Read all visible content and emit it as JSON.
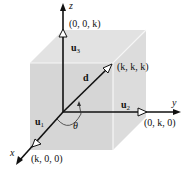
{
  "diagram": {
    "type": "3d-coordinate-cube",
    "colors": {
      "cube_fill": "#d9d9d9",
      "cube_top": "#e3e3e3",
      "cube_edge": "#f4f4f4",
      "axis": "#111111",
      "background": "#ffffff"
    },
    "axes": {
      "x": {
        "label": "x"
      },
      "y": {
        "label": "y"
      },
      "z": {
        "label": "z"
      }
    },
    "points": {
      "x_point": "(k, 0, 0)",
      "y_point": "(0, k, 0)",
      "z_point": "(0, 0, k)",
      "diag_point": "(k, k, k)"
    },
    "vectors": {
      "u1": {
        "symbol": "u",
        "sub": "1"
      },
      "u2": {
        "symbol": "u",
        "sub": "2"
      },
      "u3": {
        "symbol": "u",
        "sub": "3"
      },
      "d": {
        "symbol": "d"
      }
    },
    "angle": {
      "label": "θ"
    }
  }
}
